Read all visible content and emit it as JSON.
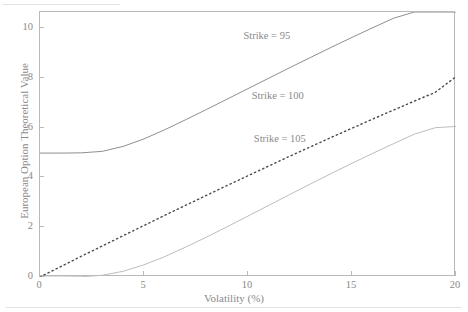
{
  "chart_data": {
    "type": "line",
    "title": "",
    "subtitle": "",
    "xlabel": "Volatility (%)",
    "ylabel": "European Option Theoretical Value",
    "xlim": [
      0,
      20
    ],
    "ylim": [
      0,
      10.65
    ],
    "xticks": [
      0,
      5,
      10,
      15,
      20
    ],
    "xtick_labels": [
      "0",
      "5",
      "10",
      "15",
      "20"
    ],
    "yticks": [
      0,
      2,
      4,
      6,
      8,
      10
    ],
    "ytick_labels": [
      "0",
      "2",
      "4",
      "6",
      "8",
      "10"
    ],
    "grid": false,
    "legend_position": "inline-annotations",
    "x": [
      0,
      1,
      2,
      3,
      4,
      5,
      6,
      7,
      8,
      9,
      10,
      11,
      12,
      13,
      14,
      15,
      16,
      17,
      18,
      19,
      20
    ],
    "series": [
      {
        "name": "Strike = 95",
        "label": "Strike = 95",
        "style": "solid",
        "color": "#8f8f8f",
        "width": 1.0,
        "values": [
          4.98,
          4.98,
          4.99,
          5.05,
          5.25,
          5.55,
          5.92,
          6.32,
          6.73,
          7.15,
          7.57,
          7.99,
          8.41,
          8.82,
          9.23,
          9.63,
          10.02,
          10.4,
          10.65,
          10.65,
          10.65
        ]
      },
      {
        "name": "Strike = 100",
        "label": "Strike = 100",
        "style": "dotted",
        "color": "#4a4a4a",
        "width": 1.4,
        "values": [
          0.0,
          0.42,
          0.84,
          1.25,
          1.66,
          2.07,
          2.48,
          2.88,
          3.28,
          3.68,
          4.07,
          4.46,
          4.85,
          5.23,
          5.61,
          5.98,
          6.35,
          6.71,
          7.07,
          7.42,
          8.05
        ]
      },
      {
        "name": "Strike = 105",
        "label": "Strike = 105",
        "style": "solid",
        "color": "#bdbdbd",
        "width": 1.0,
        "values": [
          0.0,
          0.0,
          0.01,
          0.07,
          0.23,
          0.49,
          0.82,
          1.2,
          1.6,
          2.02,
          2.45,
          2.88,
          3.31,
          3.74,
          4.16,
          4.57,
          4.97,
          5.36,
          5.74,
          6.0,
          6.05
        ]
      }
    ],
    "annotations": [
      {
        "text": "Strike = 95",
        "x": 13.0,
        "y": 9.6
      },
      {
        "text": "Strike = 100",
        "x": 13.4,
        "y": 7.2
      },
      {
        "text": "Strike = 105",
        "x": 13.5,
        "y": 5.45
      }
    ]
  },
  "axes": {
    "x_title": "Volatility (%)",
    "y_title": "European Option Theoretical Value"
  }
}
